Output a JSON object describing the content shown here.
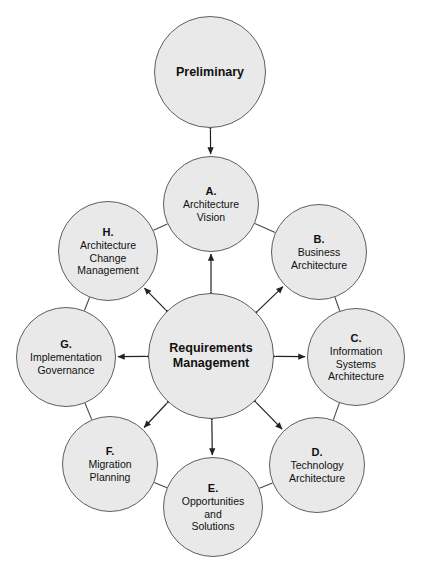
{
  "diagram": {
    "background_color": "#ffffff",
    "node_fill_color": "#e9e9e9",
    "node_stroke_color": "#5e5e5e",
    "connector_color": "#222222",
    "preliminary": {
      "name": "Preliminary",
      "label": "Preliminary",
      "cx": 210,
      "cy": 72,
      "r": 56
    },
    "hub": {
      "name": "Requirements Management",
      "line1": "Requirements",
      "line2": "Management",
      "cx": 211,
      "cy": 356,
      "r": 63
    },
    "phases": [
      {
        "key": "A",
        "letter": "A.",
        "lines": [
          "Architecture",
          "Vision"
        ],
        "cx": 211,
        "cy": 204,
        "r": 48
      },
      {
        "key": "B",
        "letter": "B.",
        "lines": [
          "Business",
          "Architecture"
        ],
        "cx": 319,
        "cy": 252,
        "r": 48
      },
      {
        "key": "C",
        "letter": "C.",
        "lines": [
          "Information",
          "Systems",
          "Architecture"
        ],
        "cx": 356,
        "cy": 357,
        "r": 49
      },
      {
        "key": "D",
        "letter": "D.",
        "lines": [
          "Technology",
          "Architecture"
        ],
        "cx": 317,
        "cy": 465,
        "r": 48
      },
      {
        "key": "E",
        "letter": "E.",
        "lines": [
          "Opportunities",
          "and",
          "Solutions"
        ],
        "cx": 213,
        "cy": 507,
        "r": 50
      },
      {
        "key": "F",
        "letter": "F.",
        "lines": [
          "Migration",
          "Planning"
        ],
        "cx": 110,
        "cy": 464,
        "r": 48
      },
      {
        "key": "G",
        "letter": "G.",
        "lines": [
          "Implementation",
          "Governance"
        ],
        "cx": 66,
        "cy": 357,
        "r": 50
      },
      {
        "key": "H",
        "letter": "H.",
        "lines": [
          "Architecture",
          "Change",
          "Management"
        ],
        "cx": 108,
        "cy": 251,
        "r": 50
      }
    ],
    "connectors": {
      "preliminary_to_vision": {
        "from": "Preliminary",
        "to": "A",
        "style": "double-arrow"
      },
      "hub_spokes_style": "double-arrow",
      "ring_links_style": "plain-line",
      "ring_order": [
        "A",
        "B",
        "C",
        "D",
        "E",
        "F",
        "G",
        "H"
      ]
    }
  }
}
